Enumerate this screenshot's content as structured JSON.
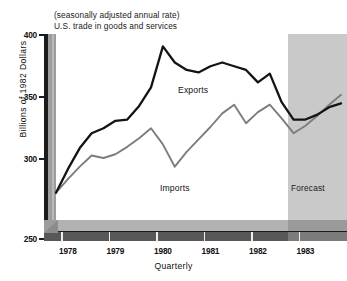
{
  "titles": {
    "subtitle_1": "(seasonally adjusted annual rate)",
    "subtitle_2": "U.S. trade in goods and services"
  },
  "annotations": {
    "forecast_label": "Forecast",
    "exports_label": "Exports",
    "imports_label": "Imports"
  },
  "colors": {
    "exports_line": "#141414",
    "imports_line": "#7d7d7d",
    "forecast_shade": "#c9c9c9",
    "floor_dark": "#585858",
    "wall_gray": "#9d9d9d",
    "plot_background": "#ffffff",
    "text": "#111111"
  },
  "chart_data": {
    "type": "line",
    "title": "U.S. trade in goods and services",
    "subtitle": "(seasonally adjusted annual rate)",
    "xlabel": "Quarterly",
    "ylabel": "Billions of 1982 Dollars",
    "ylim": [
      250,
      400
    ],
    "yticks": [
      250,
      300,
      350,
      400
    ],
    "ytick_labels": [
      "250",
      "300",
      "350",
      "400"
    ],
    "xticks": [
      1978,
      1979,
      1980,
      1981,
      1982,
      1983
    ],
    "xtick_labels": [
      "1978",
      "1979",
      "1980",
      "1981",
      "1982",
      "1983"
    ],
    "grid": false,
    "legend_position": "inline-annotation",
    "x_quarters": [
      "1977Q4",
      "1978Q1",
      "1978Q2",
      "1978Q3",
      "1978Q4",
      "1979Q1",
      "1979Q2",
      "1979Q3",
      "1979Q4",
      "1980Q1",
      "1980Q2",
      "1980Q3",
      "1980Q4",
      "1981Q1",
      "1981Q2",
      "1981Q3",
      "1981Q4",
      "1982Q1",
      "1982Q2",
      "1982Q3",
      "1982Q4",
      "1983Q1",
      "1983Q2",
      "1983Q3",
      "1983Q4"
    ],
    "series": [
      {
        "name": "Exports",
        "color": "#141414",
        "values": [
          272,
          291,
          308,
          320,
          324,
          330,
          331,
          342,
          357,
          390,
          377,
          371,
          369,
          374,
          377,
          374,
          371,
          361,
          368,
          345,
          331,
          331,
          335,
          341,
          344
        ]
      },
      {
        "name": "Imports",
        "color": "#7d7d7d",
        "values": [
          272,
          283,
          293,
          302,
          300,
          303,
          309,
          316,
          324,
          311,
          293,
          305,
          315,
          325,
          336,
          343,
          328,
          337,
          343,
          332,
          320,
          326,
          334,
          343,
          351
        ]
      }
    ],
    "forecast_region": {
      "label": "Forecast",
      "start_quarter": "1982Q4",
      "start_year_fraction": 1982.75,
      "end_year_fraction": 1984.0
    }
  }
}
